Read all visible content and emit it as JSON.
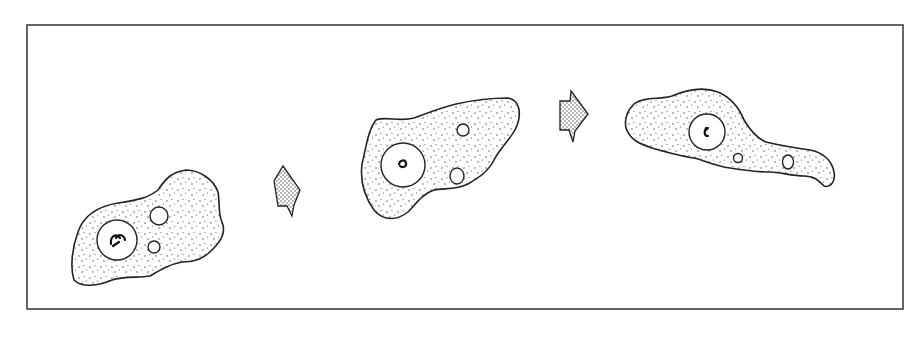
{
  "figure": {
    "stages": [
      {
        "label": "amoeba-stage-1",
        "vacuole_count": 2
      },
      {
        "label": "amoeba-stage-2",
        "vacuole_count": 2
      },
      {
        "label": "amoeba-stage-3",
        "vacuole_count": 2
      }
    ],
    "arrows": 2,
    "colors": {
      "line": "#222222",
      "background": "#ffffff"
    }
  }
}
